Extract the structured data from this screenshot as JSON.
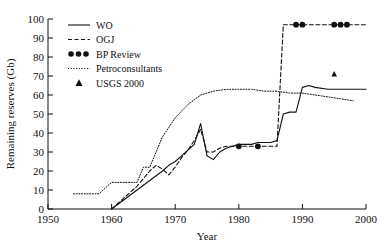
{
  "chart_data": {
    "type": "line",
    "title": "",
    "xlabel": "Year",
    "ylabel": "Remaining reserves (Gb)",
    "xlim": [
      1950,
      2000
    ],
    "ylim": [
      0,
      100
    ],
    "xticks": [
      1950,
      1960,
      1970,
      1980,
      1990,
      2000
    ],
    "yticks": [
      0,
      10,
      20,
      30,
      40,
      50,
      60,
      70,
      80,
      90,
      100
    ],
    "grid": false,
    "legend_position": "top-left",
    "series": [
      {
        "name": "WO",
        "style": "solid",
        "x": [
          1960,
          1962,
          1964,
          1966,
          1968,
          1969,
          1970,
          1971,
          1972,
          1973,
          1974,
          1975,
          1976,
          1977,
          1978,
          1979,
          1980,
          1981,
          1982,
          1983,
          1984,
          1985,
          1986,
          1987,
          1988,
          1989,
          1990,
          1991,
          1992,
          1994,
          1996,
          1998,
          2000
        ],
        "y": [
          0,
          5,
          10,
          15,
          20,
          23,
          25,
          28,
          31,
          34,
          45,
          28,
          26,
          30,
          32,
          33,
          34,
          34,
          34,
          35,
          35,
          35,
          36,
          50,
          51,
          51,
          64,
          65,
          64,
          63,
          63,
          63,
          63
        ]
      },
      {
        "name": "OGJ",
        "style": "dashed",
        "x": [
          1960,
          1962,
          1964,
          1966,
          1967,
          1968,
          1969,
          1970,
          1971,
          1972,
          1973,
          1974,
          1975,
          1976,
          1977,
          1978,
          1979,
          1980,
          1981,
          1982,
          1983,
          1984,
          1985,
          1986,
          1987,
          1988,
          1990,
          1992,
          1994,
          1996,
          1998,
          2000
        ],
        "y": [
          0,
          6,
          12,
          20,
          23,
          21,
          18,
          22,
          27,
          31,
          36,
          42,
          30,
          30,
          32,
          33,
          33,
          33,
          33,
          33,
          33,
          33,
          33,
          33,
          97,
          97,
          97,
          97,
          97,
          97,
          97,
          97
        ]
      },
      {
        "name": "Petroconsultants",
        "style": "dotted",
        "x": [
          1954,
          1956,
          1958,
          1960,
          1962,
          1964,
          1965,
          1966,
          1967,
          1968,
          1970,
          1972,
          1974,
          1976,
          1978,
          1980,
          1982,
          1984,
          1986,
          1988,
          1990,
          1992,
          1994,
          1996,
          1998
        ],
        "y": [
          8,
          8,
          8,
          14,
          14,
          14,
          22,
          22,
          30,
          38,
          48,
          55,
          60,
          62,
          63,
          63,
          63,
          62,
          62,
          61,
          61,
          60,
          59,
          58,
          57
        ]
      }
    ],
    "point_series": [
      {
        "name": "BP Review",
        "marker": "circle",
        "points": [
          {
            "x": 1980,
            "y": 33
          },
          {
            "x": 1983,
            "y": 33
          },
          {
            "x": 1989,
            "y": 97
          },
          {
            "x": 1990,
            "y": 97
          },
          {
            "x": 1995,
            "y": 97
          },
          {
            "x": 1996,
            "y": 97
          },
          {
            "x": 1997,
            "y": 97
          }
        ]
      },
      {
        "name": "USGS 2000",
        "marker": "triangle",
        "points": [
          {
            "x": 1995,
            "y": 71
          }
        ]
      }
    ],
    "legend": [
      {
        "label": "WO",
        "kind": "solid-line"
      },
      {
        "label": "OGJ",
        "kind": "dashed-line"
      },
      {
        "label": "BP Review",
        "kind": "dots"
      },
      {
        "label": "Petroconsultants",
        "kind": "dotted-line"
      },
      {
        "label": "USGS 2000",
        "kind": "triangle"
      }
    ]
  },
  "axes": {
    "x_title": "Year",
    "y_title": "Remaining reserves (Gb)",
    "x_tick_labels": [
      "1950",
      "1960",
      "1970",
      "1980",
      "1990",
      "2000"
    ],
    "y_tick_labels": [
      "0",
      "10",
      "20",
      "30",
      "40",
      "50",
      "60",
      "70",
      "80",
      "90",
      "100"
    ]
  },
  "legend_labels": {
    "wo": "WO",
    "ogj": "OGJ",
    "bp": "BP Review",
    "petro": "Petroconsultants",
    "usgs": "USGS 2000"
  },
  "colors": {
    "ink": "#111111",
    "background": "#ffffff"
  }
}
